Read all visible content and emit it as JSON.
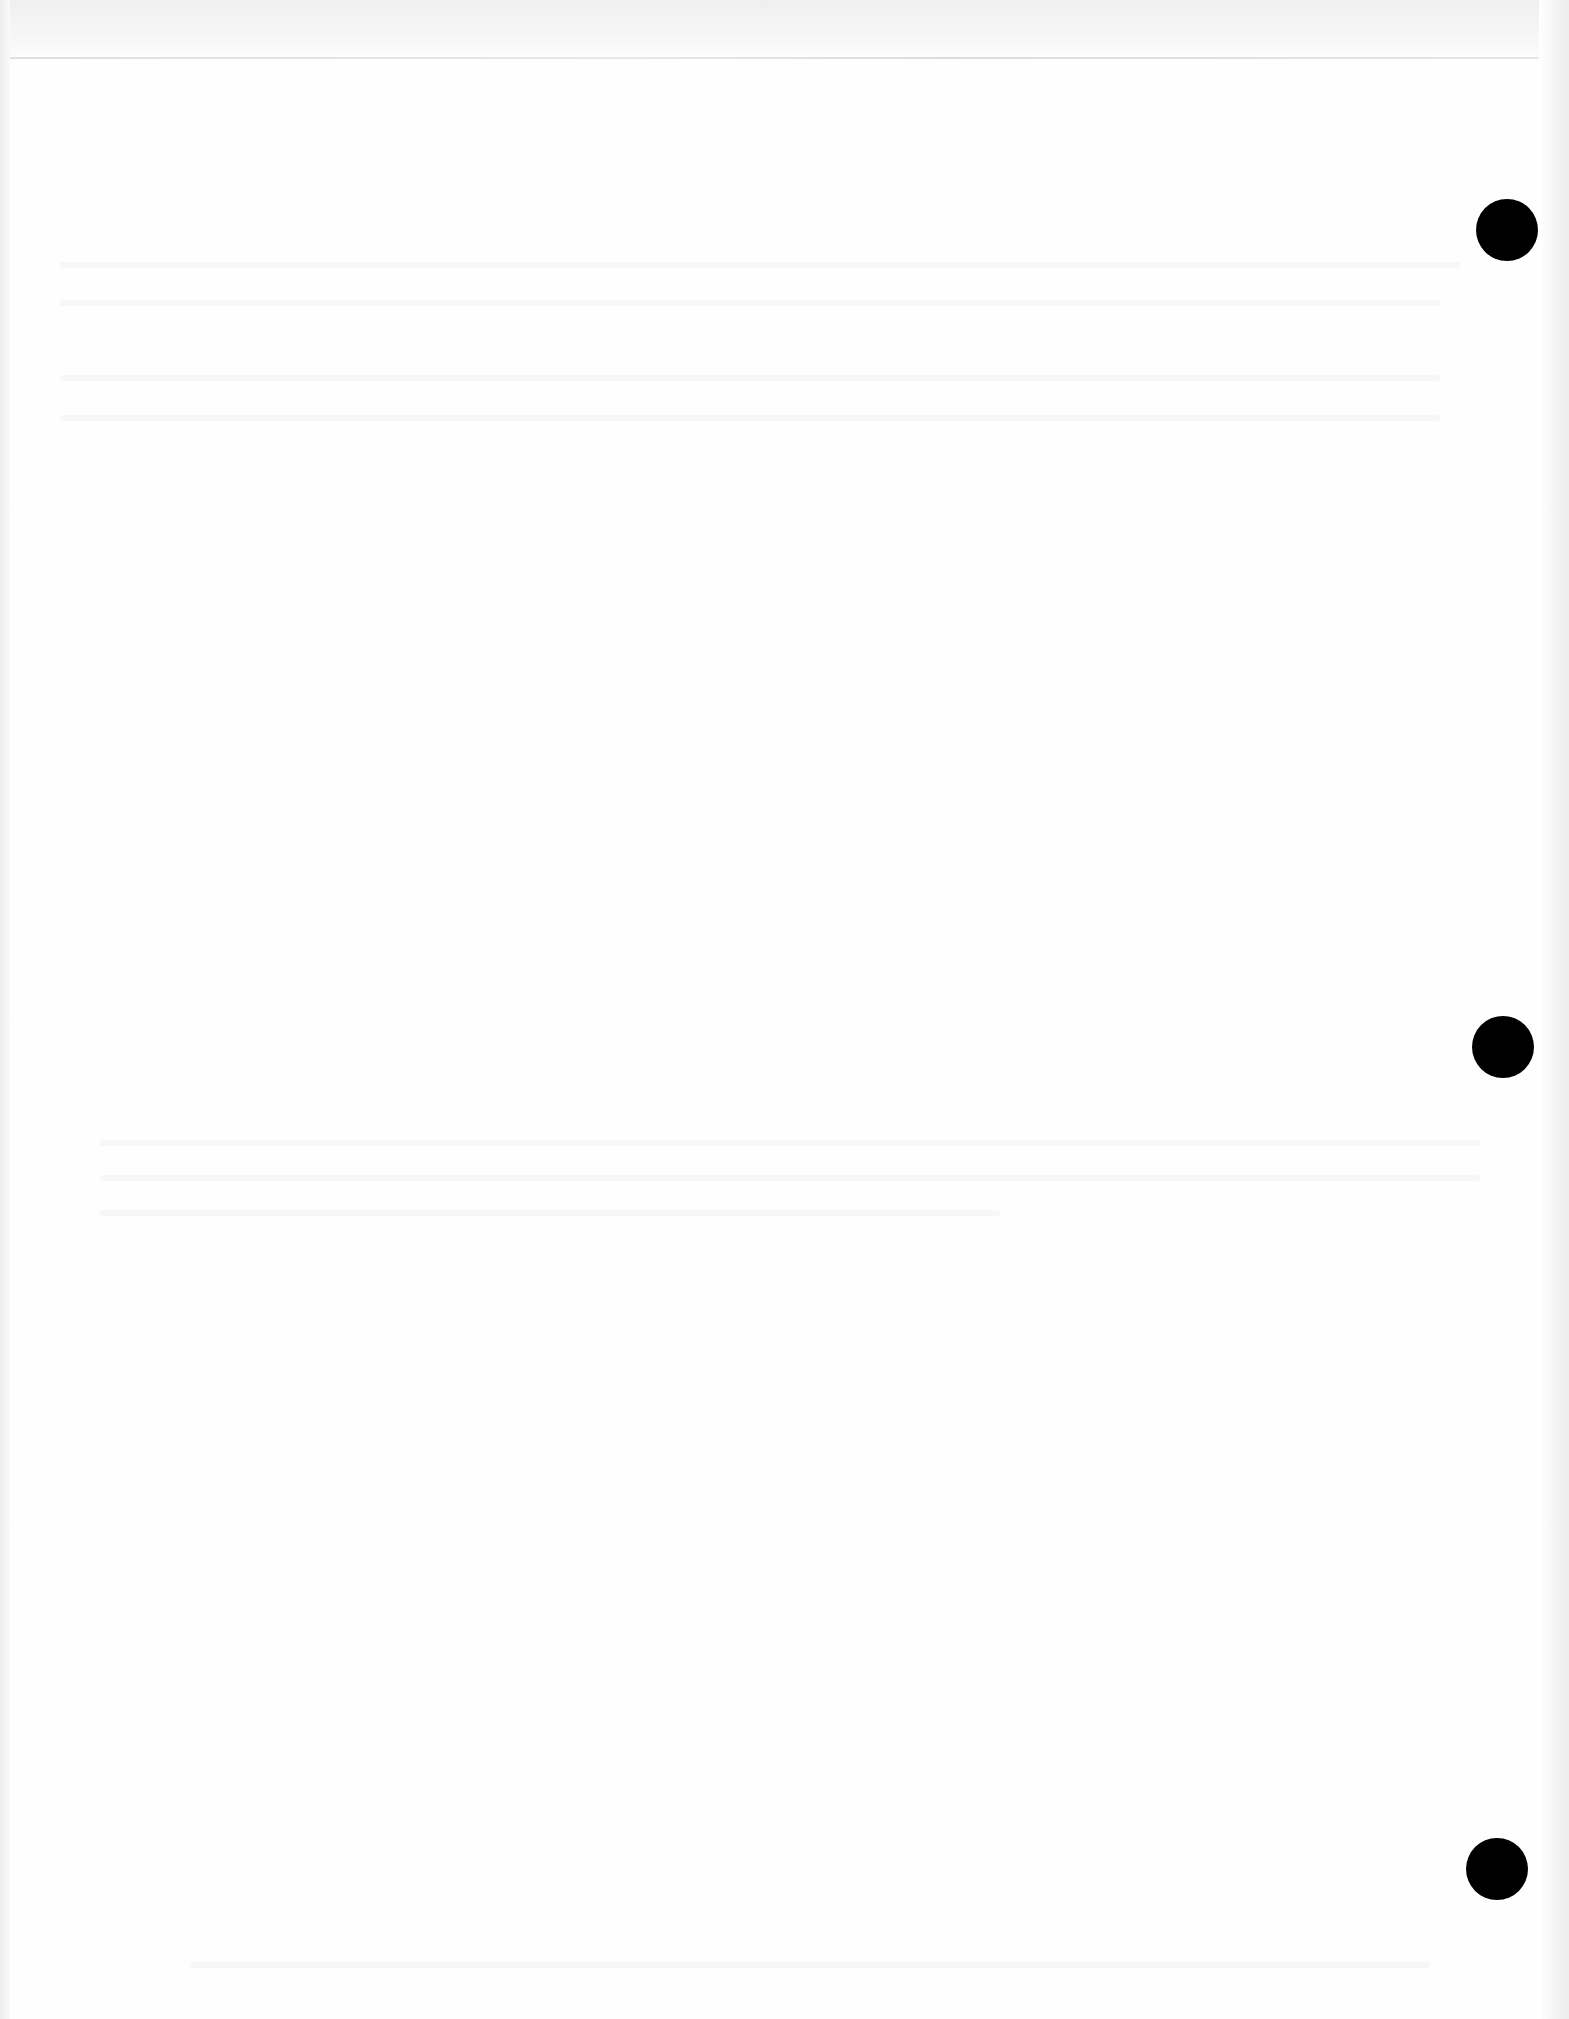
{
  "document": {
    "type": "blank scanned page",
    "background_color": "#ffffff",
    "text_content": [],
    "punch_holes": [
      {
        "label": "top",
        "cx": 1507,
        "cy": 230,
        "r": 31,
        "color": "#000000"
      },
      {
        "label": "middle",
        "cx": 1503,
        "cy": 1047,
        "r": 31,
        "color": "#000000"
      },
      {
        "label": "bottom",
        "cx": 1497,
        "cy": 1869,
        "r": 31,
        "color": "#000000"
      }
    ]
  }
}
